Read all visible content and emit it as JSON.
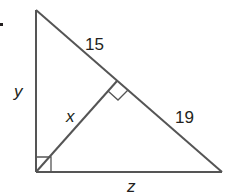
{
  "diagram": {
    "type": "right-triangle-with-altitude",
    "colors": {
      "stroke": "#555555",
      "text": "#231f20",
      "background": "#ffffff"
    },
    "labels": {
      "upper_hypotenuse_segment": "15",
      "lower_hypotenuse_segment": "19",
      "left_leg": "y",
      "altitude": "x",
      "bottom_leg": "z"
    },
    "right_angle_marks": [
      "bottom-left vertex",
      "altitude foot on hypotenuse"
    ]
  }
}
